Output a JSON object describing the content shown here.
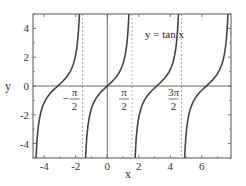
{
  "chart_data": {
    "type": "line",
    "title": "",
    "xlabel": "x",
    "ylabel": "y",
    "xlim": [
      -4.71,
      7.85
    ],
    "ylim": [
      -5,
      5
    ],
    "grid": false,
    "legend": "none",
    "x_ticks": [
      -4,
      -2,
      0,
      2,
      4,
      6
    ],
    "x_tick_labels": [
      "-4",
      "-2",
      "0",
      "2",
      "4",
      "6"
    ],
    "y_ticks": [
      -4,
      -2,
      0,
      2,
      4
    ],
    "y_tick_labels": [
      "-4",
      "-2",
      "0",
      "2",
      "4"
    ],
    "series": [
      {
        "name": "y = tan x",
        "function": "tan(x)",
        "color": "#444444"
      }
    ],
    "asymptotes": [
      {
        "x": -1.5708,
        "label_num": "π",
        "label_sign": "−",
        "label_den": "2"
      },
      {
        "x": 1.5708,
        "label_num": "π",
        "label_sign": "",
        "label_den": "2"
      },
      {
        "x": 4.7124,
        "label_num": "3π",
        "label_sign": "",
        "label_den": "2"
      }
    ],
    "annotation": {
      "text": "y = tan x",
      "x": 2.1,
      "y": 3.7
    },
    "reference_lines": [
      {
        "type": "horizontal",
        "y": 0
      },
      {
        "type": "vertical",
        "x": 0
      }
    ]
  },
  "labels": {
    "x_axis": "x",
    "y_axis": "y",
    "curve": "y = tan x"
  },
  "colors": {
    "curve": "#444444",
    "frame": "#555555",
    "asymptote": "#999999",
    "text": "#333333"
  }
}
